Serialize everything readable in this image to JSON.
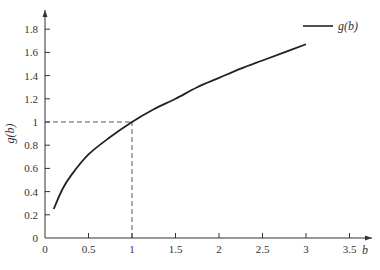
{
  "chart_data": {
    "type": "line",
    "title": "",
    "xlabel": "b",
    "ylabel": "g(b)",
    "xlim": [
      0,
      3.6
    ],
    "ylim": [
      0,
      1.9
    ],
    "grid": false,
    "legend_position": "top-right",
    "x_ticks": [
      "0",
      "0.5",
      "1",
      "1.5",
      "2",
      "2.5",
      "3",
      "3.5"
    ],
    "y_ticks": [
      "0",
      "0.2",
      "0.4",
      "0.6",
      "0.8",
      "1",
      "1.2",
      "1.4",
      "1.6",
      "1.8"
    ],
    "series": [
      {
        "name": "g(b)",
        "x": [
          0.1,
          0.2,
          0.3,
          0.5,
          0.75,
          1.0,
          1.25,
          1.5,
          1.75,
          2.0,
          2.25,
          2.5,
          2.75,
          3.0
        ],
        "y": [
          0.25,
          0.42,
          0.54,
          0.72,
          0.87,
          1.0,
          1.11,
          1.2,
          1.3,
          1.38,
          1.46,
          1.53,
          1.6,
          1.67
        ]
      }
    ],
    "annotations": [
      {
        "type": "dashed-guide",
        "from": [
          0,
          1
        ],
        "to": [
          1,
          1
        ]
      },
      {
        "type": "dashed-guide",
        "from": [
          1,
          0
        ],
        "to": [
          1,
          1
        ]
      }
    ]
  }
}
